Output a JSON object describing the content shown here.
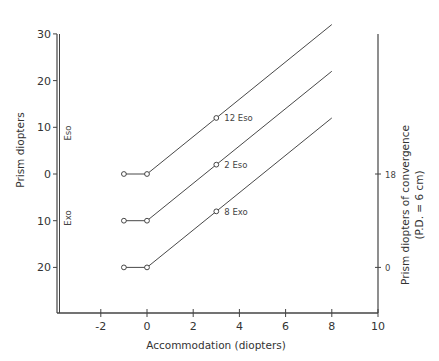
{
  "chart_data": {
    "type": "line",
    "title": "",
    "xlabel": "Accommodation (diopters)",
    "ylabel": "Prism diopters",
    "y2label": "Prism diopters of convergence",
    "y2label_sub": "(P.D. = 6 cm)",
    "xlim": [
      -3.9,
      10
    ],
    "x_ticks": [
      -2,
      0,
      2,
      4,
      6,
      8,
      10
    ],
    "x_tick_labels": [
      "-2",
      "0",
      "2",
      "4",
      "6",
      "8",
      "10"
    ],
    "y_ticks_signed": [
      30,
      20,
      10,
      0,
      -10,
      -20
    ],
    "y_tick_labels": [
      "30",
      "20",
      "10",
      "0",
      "10",
      "20"
    ],
    "y_region_labels": {
      "upper": "Eso",
      "lower": "Exo"
    },
    "y2_ticks_signed": [
      0,
      -20
    ],
    "y2_tick_labels": [
      "18",
      "0"
    ],
    "grid": false,
    "series": [
      {
        "name": "12 Eso",
        "x": [
          -1,
          0,
          3,
          8
        ],
        "y": [
          0,
          0,
          12,
          32
        ],
        "label_at": [
          3,
          12
        ]
      },
      {
        "name": "2 Eso",
        "x": [
          -1,
          0,
          3,
          8
        ],
        "y": [
          -10,
          -10,
          2,
          22
        ],
        "label_at": [
          3,
          2
        ]
      },
      {
        "name": "8 Exo",
        "x": [
          -1,
          0,
          3,
          8
        ],
        "y": [
          -20,
          -20,
          -8,
          12
        ],
        "label_at": [
          3,
          -8
        ]
      }
    ]
  }
}
